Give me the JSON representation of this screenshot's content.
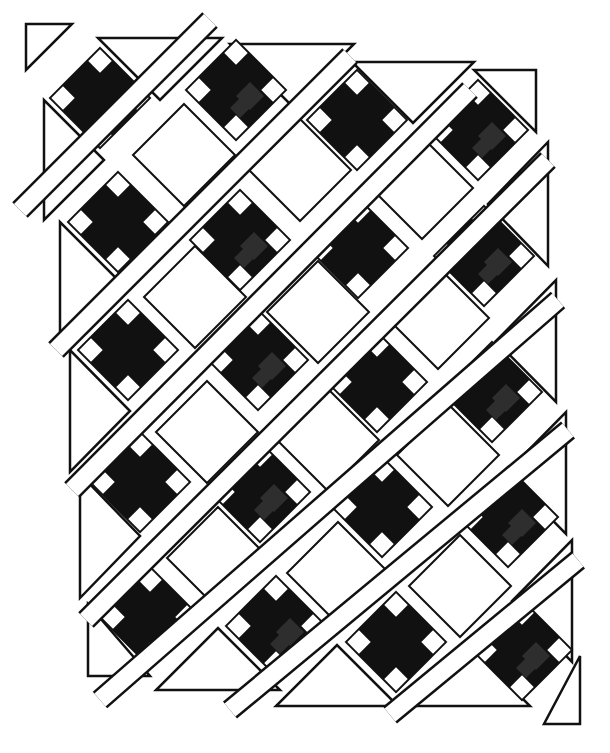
{
  "caption": {
    "text": ""
  },
  "diagram": {
    "colors": {
      "dark": "#111111",
      "print": "#2e2e2e",
      "light": "#ffffff",
      "outline": "#111111"
    },
    "block_half_diagonal": 50,
    "notch_size": 13,
    "dark_blocks": [
      [
        100,
        98
      ],
      [
        236,
        90
      ],
      [
        357,
        120
      ],
      [
        478,
        130
      ],
      [
        118,
        222
      ],
      [
        240,
        240
      ],
      [
        358,
        248
      ],
      [
        484,
        256
      ],
      [
        128,
        350
      ],
      [
        258,
        360
      ],
      [
        377,
        382
      ],
      [
        492,
        392
      ],
      [
        140,
        482
      ],
      [
        260,
        492
      ],
      [
        382,
        507
      ],
      [
        508,
        517
      ],
      [
        150,
        617
      ],
      [
        276,
        626
      ],
      [
        396,
        642
      ],
      [
        522,
        650
      ]
    ],
    "light_blocks": [
      [
        184,
        155
      ],
      [
        300,
        170
      ],
      [
        422,
        188
      ],
      [
        195,
        297
      ],
      [
        318,
        312
      ],
      [
        438,
        318
      ],
      [
        207,
        432
      ],
      [
        328,
        440
      ],
      [
        448,
        455
      ],
      [
        218,
        558
      ],
      [
        338,
        573
      ],
      [
        460,
        586
      ]
    ],
    "sashing_strips": [
      [
        [
          20,
          210
        ],
        [
          210,
          20
        ]
      ],
      [
        [
          56,
          350
        ],
        [
          350,
          56
        ]
      ],
      [
        [
          72,
          490
        ],
        [
          470,
          90
        ]
      ],
      [
        [
          86,
          620
        ],
        [
          548,
          160
        ]
      ],
      [
        [
          100,
          700
        ],
        [
          558,
          300
        ]
      ],
      [
        [
          230,
          710
        ],
        [
          568,
          430
        ]
      ],
      [
        [
          390,
          715
        ],
        [
          578,
          560
        ]
      ]
    ],
    "setting_triangles": [
      [
        [
          26,
          24
        ],
        [
          72,
          24
        ],
        [
          26,
          70
        ]
      ],
      [
        [
          98,
          38
        ],
        [
          222,
          38
        ],
        [
          160,
          100
        ]
      ],
      [
        [
          230,
          44
        ],
        [
          354,
          44
        ],
        [
          292,
          106
        ]
      ],
      [
        [
          352,
          62
        ],
        [
          474,
          62
        ],
        [
          413,
          123
        ]
      ],
      [
        [
          474,
          70
        ],
        [
          536,
          70
        ],
        [
          536,
          132
        ]
      ],
      [
        [
          44,
          100
        ],
        [
          44,
          220
        ],
        [
          104,
          160
        ]
      ],
      [
        [
          60,
          222
        ],
        [
          60,
          342
        ],
        [
          120,
          282
        ]
      ],
      [
        [
          70,
          350
        ],
        [
          70,
          472
        ],
        [
          130,
          411
        ]
      ],
      [
        [
          80,
          474
        ],
        [
          80,
          598
        ],
        [
          140,
          536
        ]
      ],
      [
        [
          88,
          604
        ],
        [
          88,
          676
        ],
        [
          150,
          676
        ]
      ],
      [
        [
          548,
          142
        ],
        [
          548,
          266
        ],
        [
          488,
          204
        ]
      ],
      [
        [
          556,
          280
        ],
        [
          556,
          402
        ],
        [
          496,
          341
        ]
      ],
      [
        [
          566,
          412
        ],
        [
          566,
          534
        ],
        [
          506,
          473
        ]
      ],
      [
        [
          572,
          540
        ],
        [
          572,
          662
        ],
        [
          512,
          601
        ]
      ],
      [
        [
          156,
          690
        ],
        [
          280,
          690
        ],
        [
          218,
          628
        ]
      ],
      [
        [
          276,
          706
        ],
        [
          398,
          706
        ],
        [
          337,
          645
        ]
      ],
      [
        [
          408,
          706
        ],
        [
          530,
          706
        ],
        [
          469,
          645
        ]
      ],
      [
        [
          544,
          724
        ],
        [
          580,
          724
        ],
        [
          580,
          656
        ]
      ]
    ]
  }
}
